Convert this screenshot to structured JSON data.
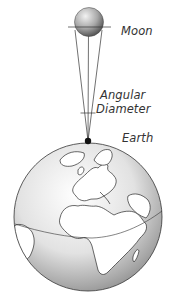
{
  "labels": {
    "moon": "Moon",
    "angular": "Angular",
    "diameter": "Diameter",
    "earth": "Earth"
  },
  "colors": {
    "line": "#333333",
    "text": "#333333",
    "moon_light": "#e6e6e6",
    "moon_dark": "#555555",
    "globe_light": "#ffffff",
    "globe_dark": "#8a8a8a",
    "observer_dot": "#111111"
  }
}
